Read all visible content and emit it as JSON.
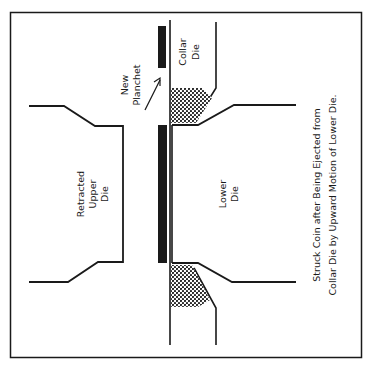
{
  "diagram": {
    "colors": {
      "ink": "#1a1a1a",
      "background": "#ffffff"
    },
    "labels": {
      "new_planchet": [
        "New",
        "Planchet"
      ],
      "collar_die": [
        "Collar",
        "Die"
      ],
      "upper_die": [
        "Retracted",
        "Upper",
        "Die"
      ],
      "lower_die": [
        "Lower",
        "Die"
      ]
    },
    "caption": [
      "Struck Coin after Being Ejected from",
      "Collar Die by Upward Motion of Lower Die."
    ]
  }
}
